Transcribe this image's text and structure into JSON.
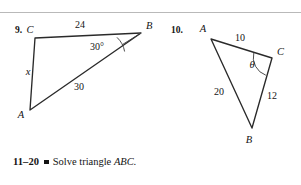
{
  "page": {
    "background_color": "#ffffff",
    "ink_color": "#141414",
    "rule_color": "#b9b9b9"
  },
  "problems": [
    {
      "number": "9.",
      "figure": {
        "type": "triangle",
        "vertices": [
          {
            "label": "C",
            "x": 35,
            "y": 38
          },
          {
            "label": "B",
            "x": 141,
            "y": 33
          },
          {
            "label": "A",
            "x": 30,
            "y": 110
          }
        ],
        "vertex_labels": [
          {
            "label": "C",
            "x": 30,
            "y": 33
          },
          {
            "label": "B",
            "x": 146,
            "y": 29
          },
          {
            "label": "A",
            "x": 21,
            "y": 118
          }
        ],
        "side_labels": [
          {
            "text": "24",
            "x": 80,
            "y": 28
          },
          {
            "text": "x",
            "x": 28,
            "y": 75
          },
          {
            "text": "30",
            "x": 79,
            "y": 90
          }
        ],
        "angle_labels": [
          {
            "text": "30°",
            "x": 97,
            "y": 50,
            "at_vertex": "B"
          }
        ]
      }
    },
    {
      "number": "10.",
      "figure": {
        "type": "triangle",
        "vertices": [
          {
            "label": "A",
            "x": 211,
            "y": 39
          },
          {
            "label": "C",
            "x": 272,
            "y": 58
          },
          {
            "label": "B",
            "x": 252,
            "y": 128
          }
        ],
        "vertex_labels": [
          {
            "label": "A",
            "x": 203,
            "y": 32
          },
          {
            "label": "C",
            "x": 277,
            "y": 55
          },
          {
            "label": "B",
            "x": 249,
            "y": 143
          }
        ],
        "side_labels": [
          {
            "text": "10",
            "x": 240,
            "y": 41
          },
          {
            "text": "20",
            "x": 219,
            "y": 95
          },
          {
            "text": "12",
            "x": 272,
            "y": 99
          }
        ],
        "angle_labels": [
          {
            "text": "θ",
            "x": 252,
            "y": 68,
            "at_vertex": "C"
          }
        ]
      }
    }
  ],
  "directive": {
    "range": "11–20",
    "bullet": "square-bullet",
    "instruction": "Solve triangle",
    "triangle_name": "ABC."
  }
}
